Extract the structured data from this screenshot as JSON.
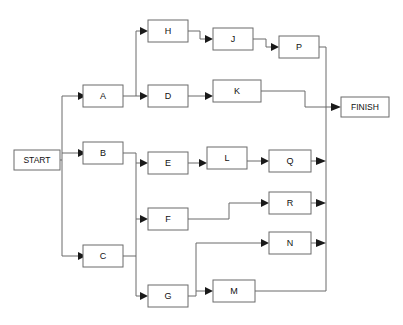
{
  "diagram": {
    "type": "flowchart",
    "canvas": {
      "width": 403,
      "height": 325
    },
    "colors": {
      "background": "#ffffff",
      "box_stroke": "#6b6b6b",
      "box_fill": "#ffffff",
      "line": "#6b6b6b",
      "arrow_fill": "#1a1a1a",
      "text": "#111111"
    },
    "terminals": {
      "start": {
        "label": "START",
        "x": 14,
        "y": 150,
        "w": 46,
        "h": 20
      },
      "finish": {
        "label": "FINISH",
        "x": 341,
        "y": 97,
        "w": 48,
        "h": 20
      }
    },
    "nodes": [
      {
        "id": "A",
        "label": "A",
        "x": 83,
        "y": 85,
        "w": 40,
        "h": 22
      },
      {
        "id": "B",
        "label": "B",
        "x": 83,
        "y": 142,
        "w": 40,
        "h": 22
      },
      {
        "id": "C",
        "label": "C",
        "x": 83,
        "y": 245,
        "w": 40,
        "h": 22
      },
      {
        "id": "D",
        "label": "D",
        "x": 148,
        "y": 85,
        "w": 40,
        "h": 22
      },
      {
        "id": "E",
        "label": "E",
        "x": 148,
        "y": 152,
        "w": 40,
        "h": 22
      },
      {
        "id": "F",
        "label": "F",
        "x": 148,
        "y": 208,
        "w": 40,
        "h": 22
      },
      {
        "id": "G",
        "label": "G",
        "x": 148,
        "y": 285,
        "w": 40,
        "h": 22
      },
      {
        "id": "H",
        "label": "H",
        "x": 148,
        "y": 20,
        "w": 40,
        "h": 22
      },
      {
        "id": "J",
        "label": "J",
        "x": 213,
        "y": 28,
        "w": 40,
        "h": 22
      },
      {
        "id": "K",
        "label": "K",
        "x": 213,
        "y": 80,
        "w": 48,
        "h": 22
      },
      {
        "id": "L",
        "label": "L",
        "x": 207,
        "y": 147,
        "w": 40,
        "h": 22
      },
      {
        "id": "M",
        "label": "M",
        "x": 213,
        "y": 280,
        "w": 42,
        "h": 22
      },
      {
        "id": "N",
        "label": "N",
        "x": 269,
        "y": 232,
        "w": 42,
        "h": 22
      },
      {
        "id": "P",
        "label": "P",
        "x": 279,
        "y": 36,
        "w": 40,
        "h": 22
      },
      {
        "id": "Q",
        "label": "Q",
        "x": 269,
        "y": 150,
        "w": 42,
        "h": 22
      },
      {
        "id": "R",
        "label": "R",
        "x": 269,
        "y": 192,
        "w": 42,
        "h": 22
      }
    ],
    "edges": [
      {
        "from": "START",
        "to": "A"
      },
      {
        "from": "START",
        "to": "B"
      },
      {
        "from": "START",
        "to": "C"
      },
      {
        "from": "A",
        "to": "H"
      },
      {
        "from": "A",
        "to": "D"
      },
      {
        "from": "H",
        "to": "J"
      },
      {
        "from": "J",
        "to": "P"
      },
      {
        "from": "P",
        "to": "FINISH"
      },
      {
        "from": "D",
        "to": "K"
      },
      {
        "from": "K",
        "to": "FINISH"
      },
      {
        "from": "B",
        "to": "E"
      },
      {
        "from": "B",
        "to": "F"
      },
      {
        "from": "B",
        "to": "G"
      },
      {
        "from": "C",
        "to": "G"
      },
      {
        "from": "E",
        "to": "L"
      },
      {
        "from": "L",
        "to": "Q"
      },
      {
        "from": "Q",
        "to": "FINISH"
      },
      {
        "from": "F",
        "to": "R"
      },
      {
        "from": "R",
        "to": "FINISH"
      },
      {
        "from": "G",
        "to": "N"
      },
      {
        "from": "G",
        "to": "M"
      },
      {
        "from": "N",
        "to": "FINISH"
      },
      {
        "from": "M",
        "to": "FINISH"
      }
    ]
  }
}
